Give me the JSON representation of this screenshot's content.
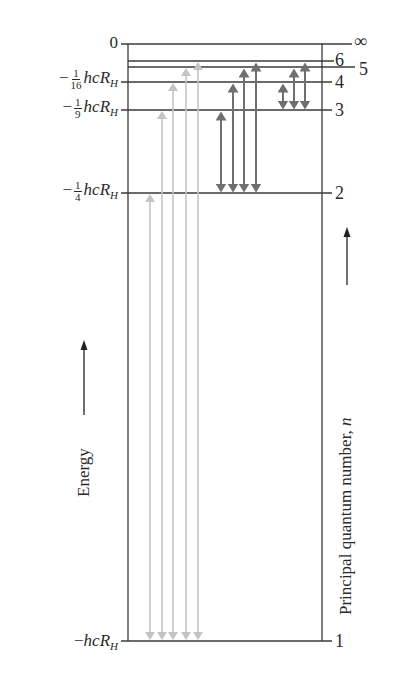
{
  "diagram": {
    "energy_axis": {
      "title": "Energy",
      "labels": [
        {
          "id": "zero",
          "text": "0"
        },
        {
          "id": "n4",
          "minus": "−",
          "num": "1",
          "den": "16",
          "symbol": "hcR",
          "sub": "H"
        },
        {
          "id": "n3",
          "minus": "−",
          "num": "1",
          "den": "9",
          "symbol": "hcR",
          "sub": "H"
        },
        {
          "id": "n2",
          "minus": "−",
          "num": "1",
          "den": "4",
          "symbol": "hcR",
          "sub": "H"
        },
        {
          "id": "n1",
          "minus": "−",
          "symbol": "hcR",
          "sub": "H"
        }
      ]
    },
    "quantum_axis": {
      "title_prefix": "Principal quantum number, ",
      "title_var": "n",
      "levels": [
        "∞",
        "6",
        "5",
        "4",
        "3",
        "2",
        "1"
      ]
    },
    "levels_y": {
      "inf": 44,
      "6": 61,
      "5": 67,
      "4": 82,
      "3": 110,
      "2": 193,
      "1": 641
    },
    "transitions": {
      "lyman": {
        "color": "#c4c4c4",
        "lower": 1,
        "uppers": [
          2,
          3,
          4,
          5,
          6
        ]
      },
      "balmer": {
        "color": "#6f6f6f",
        "lower": 2,
        "uppers": [
          3,
          4,
          5,
          6
        ]
      },
      "paschen": {
        "color": "#6f6f6f",
        "lower": 3,
        "uppers": [
          4,
          5,
          6
        ]
      }
    },
    "colors": {
      "lines": "#3a3a3a",
      "text": "#2a2a2a",
      "lyman": "#c4c4c4",
      "balmer_paschen": "#6f6f6f"
    }
  }
}
